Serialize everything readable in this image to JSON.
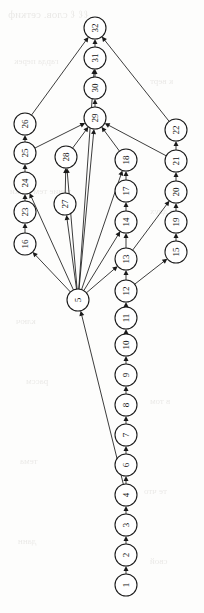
{
  "figure": {
    "type": "directed-acyclic-graph",
    "orientation": "rotated-90-ccw",
    "background_color": "#fdfdfc",
    "node_fill": "#ffffff",
    "node_stroke": "#1a1a1a",
    "edge_color": "#1a1a1a",
    "node_radius": 11
  },
  "ghost_text": {
    "note": "faint bleed-through text from reverse side of page",
    "lines": [
      {
        "text": "ℓℓ ℓ слов. сеткиф",
        "x": 8,
        "y": 8,
        "size": 11
      },
      {
        "text": "гарда перек",
        "x": 14,
        "y": 56,
        "size": 9
      },
      {
        "text": "к верт",
        "x": 150,
        "y": 76,
        "size": 9
      },
      {
        "text": "тение тем ветки",
        "x": 10,
        "y": 186,
        "size": 9
      },
      {
        "text": "в двух",
        "x": 150,
        "y": 206,
        "size": 9
      },
      {
        "text": "ключ",
        "x": 16,
        "y": 316,
        "size": 9
      },
      {
        "text": "рассм",
        "x": 26,
        "y": 376,
        "size": 9
      },
      {
        "text": "в том",
        "x": 150,
        "y": 396,
        "size": 9
      },
      {
        "text": "тема",
        "x": 20,
        "y": 456,
        "size": 9
      },
      {
        "text": "те что",
        "x": 144,
        "y": 486,
        "size": 9
      },
      {
        "text": "данн",
        "x": 18,
        "y": 536,
        "size": 9
      },
      {
        "text": "свой",
        "x": 150,
        "y": 556,
        "size": 9
      }
    ]
  },
  "graph_data": {
    "type": "diagram",
    "title": "",
    "node_count": 32,
    "edge_count": 44,
    "nodes": [
      {
        "id": 1,
        "label": "1",
        "x": 126,
        "y": 585
      },
      {
        "id": 2,
        "label": "2",
        "x": 126,
        "y": 555
      },
      {
        "id": 3,
        "label": "3",
        "x": 126,
        "y": 525
      },
      {
        "id": 4,
        "label": "4",
        "x": 126,
        "y": 495
      },
      {
        "id": 6,
        "label": "6",
        "x": 126,
        "y": 465
      },
      {
        "id": 7,
        "label": "7",
        "x": 126,
        "y": 435
      },
      {
        "id": 8,
        "label": "8",
        "x": 126,
        "y": 405
      },
      {
        "id": 9,
        "label": "9",
        "x": 126,
        "y": 375
      },
      {
        "id": 10,
        "label": "10",
        "x": 126,
        "y": 345
      },
      {
        "id": 11,
        "label": "11",
        "x": 126,
        "y": 318
      },
      {
        "id": 12,
        "label": "12",
        "x": 126,
        "y": 291
      },
      {
        "id": 13,
        "label": "13",
        "x": 126,
        "y": 259
      },
      {
        "id": 14,
        "label": "14",
        "x": 126,
        "y": 222
      },
      {
        "id": 17,
        "label": "17",
        "x": 126,
        "y": 191
      },
      {
        "id": 18,
        "label": "18",
        "x": 126,
        "y": 160
      },
      {
        "id": 5,
        "label": "5",
        "x": 78,
        "y": 300
      },
      {
        "id": 27,
        "label": "27",
        "x": 65,
        "y": 204
      },
      {
        "id": 28,
        "label": "28",
        "x": 66,
        "y": 157
      },
      {
        "id": 16,
        "label": "16",
        "x": 25,
        "y": 244
      },
      {
        "id": 23,
        "label": "23",
        "x": 25,
        "y": 212
      },
      {
        "id": 24,
        "label": "24",
        "x": 25,
        "y": 183
      },
      {
        "id": 25,
        "label": "25",
        "x": 25,
        "y": 153
      },
      {
        "id": 26,
        "label": "26",
        "x": 25,
        "y": 124
      },
      {
        "id": 15,
        "label": "15",
        "x": 176,
        "y": 252
      },
      {
        "id": 19,
        "label": "19",
        "x": 176,
        "y": 222
      },
      {
        "id": 20,
        "label": "20",
        "x": 176,
        "y": 192
      },
      {
        "id": 21,
        "label": "21",
        "x": 176,
        "y": 161
      },
      {
        "id": 22,
        "label": "22",
        "x": 176,
        "y": 130
      },
      {
        "id": 29,
        "label": "29",
        "x": 95,
        "y": 118
      },
      {
        "id": 30,
        "label": "30",
        "x": 95,
        "y": 88
      },
      {
        "id": 31,
        "label": "31",
        "x": 95,
        "y": 58
      },
      {
        "id": 32,
        "label": "32",
        "x": 95,
        "y": 28
      }
    ],
    "edges": [
      {
        "from": 1,
        "to": 2
      },
      {
        "from": 2,
        "to": 3
      },
      {
        "from": 3,
        "to": 4
      },
      {
        "from": 4,
        "to": 6
      },
      {
        "from": 6,
        "to": 7
      },
      {
        "from": 7,
        "to": 8
      },
      {
        "from": 8,
        "to": 9
      },
      {
        "from": 9,
        "to": 10
      },
      {
        "from": 10,
        "to": 11
      },
      {
        "from": 11,
        "to": 12
      },
      {
        "from": 12,
        "to": 13
      },
      {
        "from": 13,
        "to": 14
      },
      {
        "from": 14,
        "to": 17
      },
      {
        "from": 17,
        "to": 18
      },
      {
        "from": 18,
        "to": 29
      },
      {
        "from": 4,
        "to": 5
      },
      {
        "from": 5,
        "to": 16
      },
      {
        "from": 16,
        "to": 23
      },
      {
        "from": 23,
        "to": 24
      },
      {
        "from": 24,
        "to": 25
      },
      {
        "from": 25,
        "to": 26
      },
      {
        "from": 25,
        "to": 29
      },
      {
        "from": 26,
        "to": 32
      },
      {
        "from": 5,
        "to": 27
      },
      {
        "from": 27,
        "to": 28
      },
      {
        "from": 5,
        "to": 28
      },
      {
        "from": 28,
        "to": 29
      },
      {
        "from": 5,
        "to": 29
      },
      {
        "from": 5,
        "to": 24
      },
      {
        "from": 5,
        "to": 13
      },
      {
        "from": 5,
        "to": 14
      },
      {
        "from": 5,
        "to": 18
      },
      {
        "from": 5,
        "to": 31
      },
      {
        "from": 12,
        "to": 15
      },
      {
        "from": 15,
        "to": 19
      },
      {
        "from": 19,
        "to": 20
      },
      {
        "from": 20,
        "to": 21
      },
      {
        "from": 21,
        "to": 22
      },
      {
        "from": 21,
        "to": 29
      },
      {
        "from": 22,
        "to": 32
      },
      {
        "from": 29,
        "to": 30
      },
      {
        "from": 30,
        "to": 31
      },
      {
        "from": 31,
        "to": 32
      },
      {
        "from": 13,
        "to": 20
      }
    ]
  }
}
